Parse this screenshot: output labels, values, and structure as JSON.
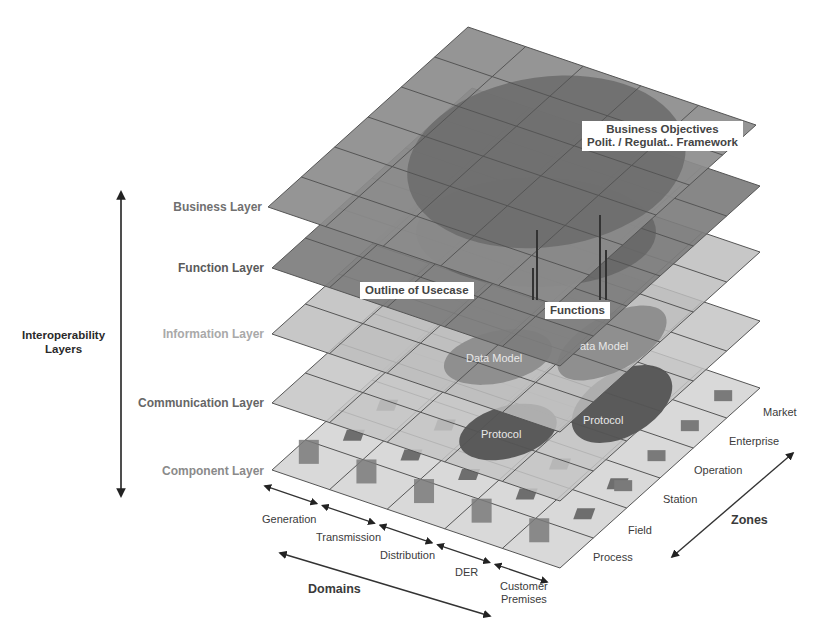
{
  "diagram": {
    "axes": {
      "interoperability": "Interoperability\nLayers",
      "interoperability_line1": "Interoperability",
      "interoperability_line2": "Layers",
      "domains": "Domains",
      "zones": "Zones"
    },
    "layers": [
      {
        "name": "Business Layer",
        "color": "#8c8c8c",
        "label_color": "#6f6f6f"
      },
      {
        "name": "Function Layer",
        "color": "#7d7d7d",
        "label_color": "#5e5e5e"
      },
      {
        "name": "Information Layer",
        "color": "#bdbdbd",
        "label_color": "#a8a8a8"
      },
      {
        "name": "Communication Layer",
        "color": "#c4c4c4",
        "label_color": "#6a6a6a"
      },
      {
        "name": "Component Layer",
        "color": "#d2d2d2",
        "label_color": "#8a8a8a"
      }
    ],
    "domains": [
      "Generation",
      "Transmission",
      "Distribution",
      "DER",
      "Customer Premises"
    ],
    "domain_customer_line1": "Customer",
    "domain_customer_line2": "Premises",
    "zones": [
      "Process",
      "Field",
      "Station",
      "Operation",
      "Enterprise",
      "Market"
    ],
    "callouts": {
      "business_objectives_line1": "Business Objectives",
      "business_objectives_line2": "Polit. / Regulat.. Framework",
      "outline_of_usecase": "Outline of Usecase",
      "functions": "Functions"
    },
    "inner_labels": {
      "data_model_1": "Data Model",
      "data_model_2": "ata Model",
      "protocol_1": "Protocol",
      "protocol_2": "Protocol"
    }
  }
}
